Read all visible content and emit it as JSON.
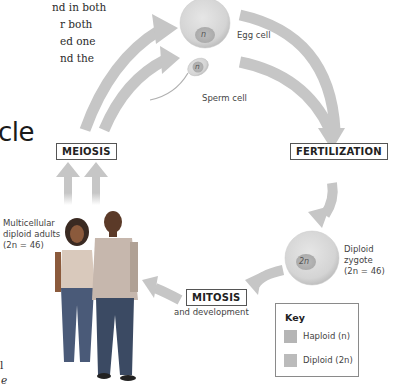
{
  "intro_text": {
    "lines": [
      "nd in both",
      "r both",
      "ed one",
      "nd the"
    ]
  },
  "section_title_fragment": "cle",
  "diagram": {
    "egg_cell": {
      "label": "Egg cell",
      "nucleus": "n"
    },
    "sperm_cell": {
      "label": "Sperm cell",
      "nucleus": "n"
    },
    "zygote": {
      "label_lines": [
        "Diploid",
        "zygote",
        "(2n = 46)"
      ],
      "nucleus": "2n"
    },
    "adults": {
      "label_lines": [
        "Multicellular",
        "diploid adults",
        "(2n = 46)"
      ]
    },
    "stages": {
      "meiosis": "MEIOSIS",
      "fertilization": "FERTILIZATION",
      "mitosis": "MITOSIS",
      "mitosis_sub": "and development"
    },
    "key": {
      "title": "Key",
      "items": [
        {
          "label": "Haploid (n)",
          "color": "#b0b0b0"
        },
        {
          "label": "Diploid (2n)",
          "color": "#b8b8b8"
        }
      ]
    },
    "colors": {
      "arrow": "#c4c4c4",
      "cell_fill": "#d8d8d8",
      "nucleus_fill": "#b3b3b3"
    }
  },
  "left_margin_fragments": [
    "l",
    "e"
  ]
}
